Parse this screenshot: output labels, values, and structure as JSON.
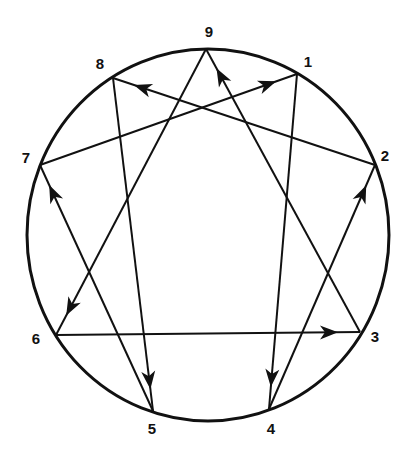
{
  "diagram": {
    "type": "enneagram",
    "stroke_color": "#111111",
    "background": "#ffffff",
    "circle": {
      "cx": 208,
      "cy": 235,
      "rx": 181,
      "ry": 186
    },
    "points": [
      {
        "id": "9",
        "label": "9",
        "x": 206,
        "y": 49,
        "lx": 209,
        "ly": 37
      },
      {
        "id": "1",
        "label": "1",
        "x": 297,
        "y": 74,
        "lx": 308,
        "ly": 67
      },
      {
        "id": "2",
        "label": "2",
        "x": 375,
        "y": 165,
        "lx": 385,
        "ly": 161
      },
      {
        "id": "3",
        "label": "3",
        "x": 360,
        "y": 332,
        "lx": 375,
        "ly": 342
      },
      {
        "id": "4",
        "label": "4",
        "x": 269,
        "y": 409,
        "lx": 271,
        "ly": 434
      },
      {
        "id": "5",
        "label": "5",
        "x": 153,
        "y": 411,
        "lx": 152,
        "ly": 434
      },
      {
        "id": "6",
        "label": "6",
        "x": 56,
        "y": 335,
        "lx": 36,
        "ly": 344
      },
      {
        "id": "7",
        "label": "7",
        "x": 40,
        "y": 165,
        "lx": 26,
        "ly": 163
      },
      {
        "id": "8",
        "label": "8",
        "x": 113,
        "y": 78,
        "lx": 100,
        "ly": 69
      }
    ],
    "arrows": [
      {
        "from": "1",
        "to": "4"
      },
      {
        "from": "4",
        "to": "2"
      },
      {
        "from": "2",
        "to": "8"
      },
      {
        "from": "8",
        "to": "5"
      },
      {
        "from": "5",
        "to": "7"
      },
      {
        "from": "7",
        "to": "1"
      },
      {
        "from": "3",
        "to": "9"
      },
      {
        "from": "9",
        "to": "6"
      },
      {
        "from": "6",
        "to": "3"
      }
    ]
  }
}
